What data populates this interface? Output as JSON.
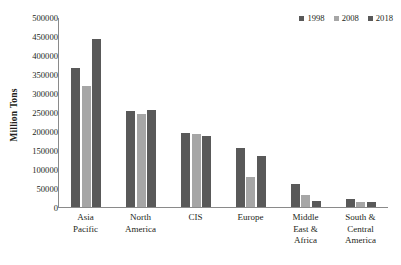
{
  "chart_data": {
    "type": "bar",
    "title": "",
    "subtitle": "",
    "xlabel": "",
    "ylabel": "Million Tons",
    "ylim": [
      0,
      500000
    ],
    "ytick_step": 50000,
    "yticks": [
      "500000",
      "450000",
      "400000",
      "350000",
      "300000",
      "250000",
      "200000",
      "150000",
      "100000",
      "50000",
      "0"
    ],
    "ytick_values": [
      500000,
      450000,
      400000,
      350000,
      300000,
      250000,
      200000,
      150000,
      100000,
      50000,
      0
    ],
    "grid": false,
    "legend_position": "top-right",
    "categories": [
      "Asia Pacific",
      "North America",
      "CIS",
      "Europe",
      "Middle East & Africa",
      "South & Central America"
    ],
    "category_lines": [
      [
        "Asia",
        "Pacific"
      ],
      [
        "North",
        "America"
      ],
      [
        "CIS"
      ],
      [
        "Europe"
      ],
      [
        "Middle",
        "East &",
        "Africa"
      ],
      [
        "South &",
        "Central",
        "America"
      ]
    ],
    "series": [
      {
        "name": "1998",
        "color": "#595959",
        "values": [
          367000,
          255000,
          195000,
          155000,
          60000,
          20000
        ]
      },
      {
        "name": "2008",
        "color": "#a6a6a6",
        "values": [
          320000,
          245000,
          192000,
          80000,
          32000,
          14000
        ]
      },
      {
        "name": "2018",
        "color": "#595959",
        "values": [
          445000,
          257000,
          188000,
          135000,
          15000,
          13000
        ]
      }
    ]
  },
  "legend": {
    "items": [
      {
        "label": "1998",
        "color": "#595959"
      },
      {
        "label": "2008",
        "color": "#a6a6a6"
      },
      {
        "label": "2018",
        "color": "#595959"
      }
    ]
  },
  "axis": {
    "y_title": "Million Tons"
  }
}
